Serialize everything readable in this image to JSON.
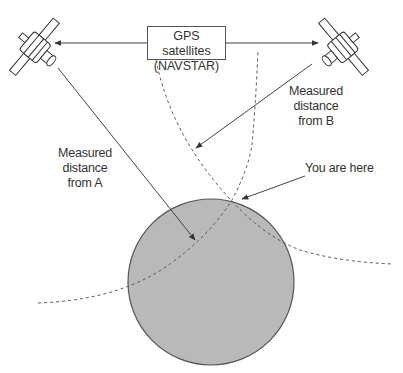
{
  "diagram": {
    "title_box": {
      "line1": "GPS satellites",
      "line2": "(NAVSTAR)"
    },
    "labels": {
      "distance_a": [
        "Measured",
        "distance",
        "from A"
      ],
      "distance_b": [
        "Measured",
        "distance",
        "from B"
      ],
      "you_are_here": "You are here"
    },
    "colors": {
      "earth_fill": "#b9b9b9",
      "line": "#444444",
      "background": "#ffffff"
    }
  }
}
